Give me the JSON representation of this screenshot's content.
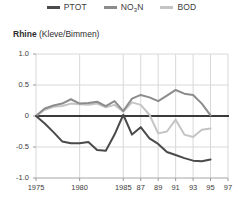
{
  "legend": {
    "items": [
      {
        "label": "PTOT",
        "sub": "",
        "color": "#4a4a4a",
        "name": "legend-item-ptot"
      },
      {
        "label": "NO",
        "sub": "3",
        "label_tail": "N",
        "color": "#8c8c8c",
        "name": "legend-item-no3n"
      },
      {
        "label": "BOD",
        "sub": "",
        "color": "#c4c4c4",
        "name": "legend-item-bod"
      }
    ]
  },
  "title": {
    "main": "Rhine",
    "sub": " (Kleve/Bimmen)"
  },
  "chart_data": {
    "type": "line",
    "title": "Rhine (Kleve/Bimmen)",
    "xlabel": "",
    "ylabel": "",
    "xlim": [
      1975,
      1997
    ],
    "ylim": [
      -1.0,
      1.0
    ],
    "grid": true,
    "legend_position": "top-center",
    "yticks": [
      1.0,
      0.5,
      0,
      -0.5,
      -1.0
    ],
    "yticklabels": [
      "1.0",
      "0.5",
      "0",
      "-0.5",
      "-1.0"
    ],
    "xticks": [
      1975,
      1980,
      1985,
      1987,
      1989,
      1991,
      1993,
      1995,
      1997
    ],
    "xticklabels": [
      "1975",
      "1980",
      "1985",
      "87",
      "89",
      "91",
      "93",
      "95",
      "97"
    ],
    "zero_line": true,
    "x": [
      1975,
      1976,
      1977,
      1978,
      1979,
      1980,
      1981,
      1982,
      1983,
      1984,
      1985,
      1986,
      1987,
      1988,
      1989,
      1990,
      1991,
      1992,
      1993,
      1994,
      1995
    ],
    "series": [
      {
        "name": "PTOT",
        "color": "#4a4a4a",
        "values": [
          0.0,
          -0.12,
          -0.26,
          -0.41,
          -0.44,
          -0.44,
          -0.42,
          -0.55,
          -0.56,
          -0.3,
          0.02,
          -0.3,
          -0.18,
          -0.36,
          -0.45,
          -0.58,
          -0.63,
          -0.68,
          -0.72,
          -0.73,
          -0.7
        ]
      },
      {
        "name": "NO3N",
        "color": "#8c8c8c",
        "values": [
          0.0,
          0.12,
          0.17,
          0.2,
          0.27,
          0.2,
          0.21,
          0.23,
          0.16,
          0.24,
          0.08,
          0.28,
          0.34,
          0.3,
          0.24,
          0.33,
          0.42,
          0.36,
          0.34,
          0.2,
          0.01
        ]
      },
      {
        "name": "BOD",
        "color": "#c4c4c4",
        "values": [
          0.0,
          0.1,
          0.15,
          0.16,
          0.2,
          0.19,
          0.18,
          0.2,
          0.14,
          0.18,
          0.07,
          0.22,
          0.18,
          0.02,
          -0.28,
          -0.25,
          -0.06,
          -0.3,
          -0.34,
          -0.22,
          -0.2
        ]
      }
    ]
  }
}
